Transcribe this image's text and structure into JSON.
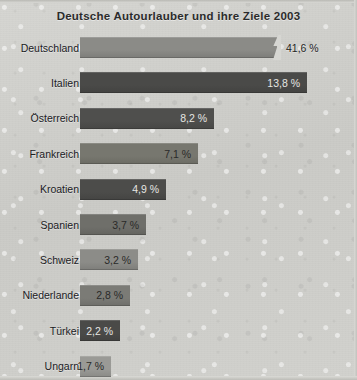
{
  "chart_data": {
    "type": "bar",
    "orientation": "horizontal",
    "title": "Deutsche Autourlauber und ihre Ziele 2003",
    "xlabel": "",
    "ylabel": "",
    "unit": "%",
    "grid": false,
    "legend": false,
    "axis_break": true,
    "axis_break_note": "Balken fuer Deutschland ist abgeschnitten (Achsenunterbrechung)",
    "categories": [
      "Deutschland",
      "Italien",
      "Österreich",
      "Frankreich",
      "Kroatien",
      "Spanien",
      "Schweiz",
      "Niederlande",
      "Türkei",
      "Ungarn"
    ],
    "values": [
      41.6,
      13.8,
      8.2,
      7.1,
      4.9,
      3.7,
      3.2,
      2.8,
      2.2,
      1.7
    ],
    "value_labels": [
      "41,6 %",
      "13,8 %",
      "8,2 %",
      "7,1 %",
      "4,9 %",
      "3,7 %",
      "3,2 %",
      "2,8 %",
      "2,2 %",
      "1,7 %"
    ],
    "xlim": [
      0,
      41.6
    ]
  },
  "bars": [
    {
      "label": "Deutschland",
      "value_label": "41,6 %",
      "value": 41.6,
      "width_px": 197,
      "color": "#8b8b87",
      "label_inside": false,
      "label_tone": "outside",
      "truncated": true
    },
    {
      "label": "Italien",
      "value_label": "13,8 %",
      "value": 13.8,
      "width_px": 227,
      "color": "#4a4a48",
      "label_inside": true,
      "label_tone": "on-dark",
      "truncated": false
    },
    {
      "label": "Österreich",
      "value_label": "8,2 %",
      "value": 8.2,
      "width_px": 134,
      "color": "#4f4f4d",
      "label_inside": true,
      "label_tone": "on-dark",
      "truncated": false
    },
    {
      "label": "Frankreich",
      "value_label": "7,1 %",
      "value": 7.1,
      "width_px": 118,
      "color": "#77776f",
      "label_inside": true,
      "label_tone": "on-light",
      "truncated": false
    },
    {
      "label": "Kroatien",
      "value_label": "4,9 %",
      "value": 4.9,
      "width_px": 86,
      "color": "#4c4c4a",
      "label_inside": true,
      "label_tone": "on-dark",
      "truncated": false
    },
    {
      "label": "Spanien",
      "value_label": "3,7 %",
      "value": 3.7,
      "width_px": 66,
      "color": "#6f6f6a",
      "label_inside": true,
      "label_tone": "on-light",
      "truncated": false
    },
    {
      "label": "Schweiz",
      "value_label": "3,2 %",
      "value": 3.2,
      "width_px": 58,
      "color": "#8c8c88",
      "label_inside": true,
      "label_tone": "on-light",
      "truncated": false
    },
    {
      "label": "Niederlande",
      "value_label": "2,8 %",
      "value": 2.8,
      "width_px": 50,
      "color": "#7b7b76",
      "label_inside": true,
      "label_tone": "on-light",
      "truncated": false
    },
    {
      "label": "Türkei",
      "value_label": "2,2 %",
      "value": 2.2,
      "width_px": 40,
      "color": "#4a4a48",
      "label_inside": true,
      "label_tone": "on-dark",
      "truncated": false
    },
    {
      "label": "Ungarn",
      "value_label": "1,7 %",
      "value": 1.7,
      "width_px": 31,
      "color": "#9a9a96",
      "label_inside": true,
      "label_tone": "on-light",
      "truncated": false
    }
  ],
  "colors": {
    "background": "#d2d2ce",
    "title_text": "#2b2b2b",
    "label_text": "#20201f",
    "bar_light": "#8b8b87",
    "bar_dark": "#4a4a48"
  }
}
